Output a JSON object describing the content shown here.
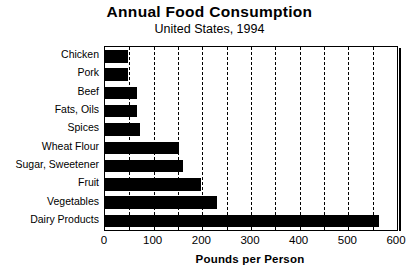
{
  "chart_data": {
    "type": "bar",
    "orientation": "horizontal",
    "title": "Annual Food Consumption",
    "subtitle": "United States, 1994",
    "xlabel": "Pounds per Person",
    "ylabel": "",
    "xlim": [
      0,
      600
    ],
    "xticks": [
      0,
      100,
      200,
      300,
      400,
      500,
      600
    ],
    "xtick_labels": [
      "0",
      "100",
      "200",
      "300",
      "400",
      "500",
      "600"
    ],
    "minor_tick_interval": 50,
    "grid": true,
    "grid_axis": "x",
    "grid_style": "dashed",
    "legend": false,
    "bar_color": "#000000",
    "background_color": "#ffffff",
    "categories": [
      "Chicken",
      "Pork",
      "Beef",
      "Fats, Oils",
      "Spices",
      "Wheat Flour",
      "Sugar, Sweetener",
      "Fruit",
      "Vegetables",
      "Dairy Products"
    ],
    "values": [
      47,
      47,
      65,
      65,
      72,
      152,
      160,
      197,
      230,
      563
    ],
    "units": "pounds per person per year"
  }
}
